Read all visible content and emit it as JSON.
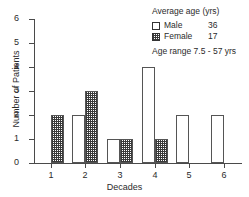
{
  "chart_data": {
    "type": "bar",
    "title": "",
    "xlabel": "Decades",
    "ylabel": "Number of Patients",
    "categories": [
      "1",
      "2",
      "3",
      "4",
      "5",
      "6"
    ],
    "series": [
      {
        "name": "Male",
        "values": [
          0,
          2,
          1,
          4,
          2,
          2
        ]
      },
      {
        "name": "Female",
        "values": [
          2,
          3,
          1,
          1,
          0,
          0
        ]
      }
    ],
    "ylim": [
      0,
      6
    ],
    "yticks": [
      0,
      1,
      2,
      3,
      4,
      5,
      6
    ],
    "grid": false,
    "legend_position": "top-right"
  },
  "legend": {
    "title": "Average age (yrs)",
    "rows": [
      {
        "swatch": "male-swatch",
        "name": "Male",
        "value": "36"
      },
      {
        "swatch": "female-swatch",
        "name": "Female",
        "value": "17"
      }
    ],
    "note": "Age range 7.5 - 57 yrs"
  },
  "axes": {
    "y_title": "Number of Patients",
    "x_title": "Decades",
    "y_tick_labels": [
      "0",
      "1",
      "2",
      "3",
      "4",
      "5",
      "6"
    ],
    "x_tick_labels": [
      "1",
      "2",
      "3",
      "4",
      "5",
      "6"
    ]
  }
}
